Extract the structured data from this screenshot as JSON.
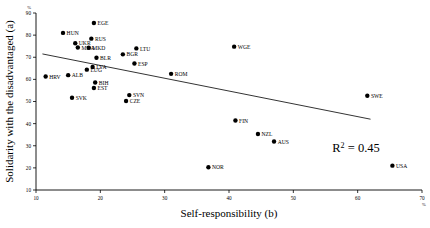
{
  "chart_data": {
    "type": "scatter",
    "title": "",
    "xlabel": "Self-responsibility (b)",
    "ylabel": "Solidarity with the disadvantaged (a)",
    "xlim": [
      10,
      70
    ],
    "ylim": [
      10,
      90
    ],
    "xticks": [
      10,
      20,
      30,
      40,
      50,
      60,
      70
    ],
    "yticks": [
      10,
      20,
      30,
      40,
      50,
      60,
      70,
      80,
      90
    ],
    "x_unit": "%",
    "y_unit": "%",
    "grid": false,
    "legend": "none",
    "annotations": {
      "r2_label": "R",
      "r2_exponent": "2",
      "r2_value": "= 0.45",
      "r2_full": "R2 = 0.45"
    },
    "trendline": {
      "type": "linear",
      "r_squared": 0.45,
      "x_start": 11.0,
      "y_start": 71.5,
      "x_end": 62.0,
      "y_end": 42.0
    },
    "points": [
      {
        "label": "EGE",
        "x": 19.0,
        "y": 85.5
      },
      {
        "label": "HUN",
        "x": 14.2,
        "y": 81.0
      },
      {
        "label": "RUS",
        "x": 18.6,
        "y": 78.4
      },
      {
        "label": "UKR",
        "x": 16.1,
        "y": 76.3
      },
      {
        "label": "MDA",
        "x": 16.5,
        "y": 74.4
      },
      {
        "label": "MKD",
        "x": 18.2,
        "y": 74.3
      },
      {
        "label": "LTU",
        "x": 25.6,
        "y": 74.0
      },
      {
        "label": "BGR",
        "x": 23.5,
        "y": 71.3
      },
      {
        "label": "BLR",
        "x": 19.4,
        "y": 69.8
      },
      {
        "label": "ESP",
        "x": 25.3,
        "y": 67.2
      },
      {
        "label": "LVA",
        "x": 18.8,
        "y": 65.6
      },
      {
        "label": "LUG",
        "x": 17.9,
        "y": 64.4
      },
      {
        "label": "ROM",
        "x": 31.0,
        "y": 62.5
      },
      {
        "label": "WGE",
        "x": 40.8,
        "y": 74.8
      },
      {
        "label": "HRV",
        "x": 11.5,
        "y": 61.3
      },
      {
        "label": "ALB",
        "x": 15.0,
        "y": 61.9
      },
      {
        "label": "BIH",
        "x": 19.2,
        "y": 58.6
      },
      {
        "label": "EST",
        "x": 19.0,
        "y": 56.1
      },
      {
        "label": "SVK",
        "x": 15.6,
        "y": 51.7
      },
      {
        "label": "SVN",
        "x": 24.5,
        "y": 52.9
      },
      {
        "label": "CZE",
        "x": 24.0,
        "y": 50.2
      },
      {
        "label": "SWE",
        "x": 61.5,
        "y": 52.6
      },
      {
        "label": "FIN",
        "x": 41.0,
        "y": 41.4
      },
      {
        "label": "NZL",
        "x": 44.5,
        "y": 35.3
      },
      {
        "label": "AUS",
        "x": 47.0,
        "y": 31.9
      },
      {
        "label": "USA",
        "x": 65.4,
        "y": 21.0
      },
      {
        "label": "NOR",
        "x": 36.8,
        "y": 20.3
      }
    ]
  }
}
